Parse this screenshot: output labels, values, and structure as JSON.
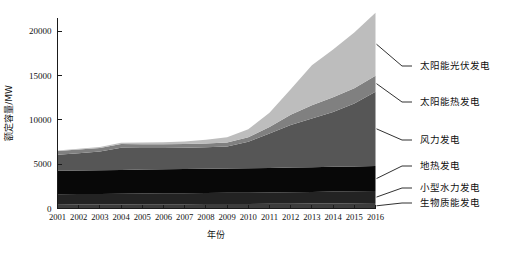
{
  "chart_data": {
    "type": "area",
    "stacked": true,
    "title": "",
    "xlabel": "年份",
    "ylabel": "额定容量/MW",
    "grid": false,
    "legend_position": "right-outside-leader-lines",
    "xlim": [
      2001,
      2016
    ],
    "ylim": [
      0,
      21500
    ],
    "yticks": [
      0,
      5000,
      10000,
      15000,
      20000
    ],
    "ytick_labels": [
      "0",
      "5000",
      "10000",
      "15000",
      "20000"
    ],
    "categories": [
      2001,
      2002,
      2003,
      2004,
      2005,
      2006,
      2007,
      2008,
      2009,
      2010,
      2011,
      2012,
      2013,
      2014,
      2015,
      2016
    ],
    "xtick_labels": [
      "2001",
      "2002",
      "2003",
      "2004",
      "2005",
      "2006",
      "2007",
      "2008",
      "2009",
      "2010",
      "2011",
      "2012",
      "2013",
      "2014",
      "2015",
      "2016"
    ],
    "series": [
      {
        "name": "生物质能发电",
        "color": "#3c3c3c",
        "values": [
          430,
          440,
          450,
          460,
          470,
          480,
          490,
          500,
          510,
          520,
          530,
          545,
          560,
          575,
          590,
          610
        ]
      },
      {
        "name": "小型水力发电",
        "color": "#232323",
        "values": [
          1180,
          1190,
          1200,
          1210,
          1220,
          1230,
          1240,
          1250,
          1260,
          1270,
          1285,
          1300,
          1315,
          1330,
          1345,
          1360
        ]
      },
      {
        "name": "地热发电",
        "color": "#080808",
        "values": [
          2650,
          2660,
          2670,
          2680,
          2700,
          2710,
          2720,
          2730,
          2740,
          2750,
          2760,
          2775,
          2790,
          2800,
          2810,
          2820
        ]
      },
      {
        "name": "风力发电",
        "color": "#565656",
        "values": [
          1800,
          1950,
          2100,
          2500,
          2450,
          2400,
          2400,
          2420,
          2500,
          3000,
          3900,
          4800,
          5500,
          6200,
          7100,
          8400
        ]
      },
      {
        "name": "太阳能热发电",
        "color": "#808080",
        "values": [
          420,
          420,
          420,
          420,
          420,
          420,
          420,
          430,
          440,
          500,
          720,
          1150,
          1500,
          1650,
          1720,
          1800
        ]
      },
      {
        "name": "太阳能光伏发电",
        "color": "#bdbdbd",
        "values": [
          70,
          90,
          110,
          140,
          180,
          230,
          300,
          420,
          600,
          900,
          1600,
          2900,
          4500,
          5400,
          6300,
          7100
        ]
      }
    ],
    "totals": [
      6550,
      6750,
      6950,
      7410,
      7440,
      7470,
      7570,
      7750,
      8050,
      8940,
      10795,
      13470,
      16165,
      17955,
      19865,
      22090
    ]
  },
  "legend": {
    "entries": [
      {
        "label": "太阳能光伏发电",
        "color": "#bdbdbd"
      },
      {
        "label": "太阳能热发电",
        "color": "#808080"
      },
      {
        "label": "风力发电",
        "color": "#565656"
      },
      {
        "label": "地热发电",
        "color": "#080808"
      },
      {
        "label": "小型水力发电",
        "color": "#232323"
      },
      {
        "label": "生物质能发电",
        "color": "#3c3c3c"
      }
    ]
  },
  "axes": {
    "y_title": "额定容量/MW",
    "x_title": "年份"
  }
}
